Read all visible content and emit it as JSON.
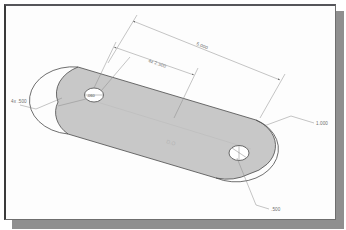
{
  "sheet": {
    "background_color": "#fdfdfd",
    "border_color": "#3a3a3a",
    "shadow_color": "#8f8f8f"
  },
  "part": {
    "name": "slotted-plate",
    "fill_color": "#c8c8c8",
    "edge_color": "#4a4a4a",
    "center_label": "D.O"
  },
  "dimensions": {
    "overall_length": "5.000",
    "hole_spacing": "4x 2.500",
    "corner_radius": "4x .500",
    "thickness": "1.000",
    "hole_depth": ".500",
    "hole_diameter": ".060"
  },
  "holes": [
    {
      "name": "left-hole",
      "label": ".060"
    },
    {
      "name": "right-hole",
      "label": ""
    }
  ],
  "line_color": "#8a8a8a"
}
